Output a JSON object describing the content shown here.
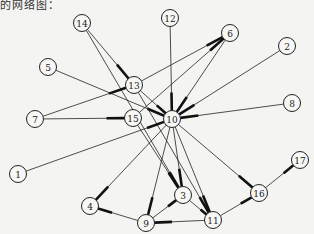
{
  "header": {
    "text": "的网络图："
  },
  "graph": {
    "nodes": [
      {
        "id": "1",
        "x": 18,
        "y": 174
      },
      {
        "id": "2",
        "x": 287,
        "y": 46
      },
      {
        "id": "3",
        "x": 183,
        "y": 195
      },
      {
        "id": "4",
        "x": 90,
        "y": 206
      },
      {
        "id": "5",
        "x": 48,
        "y": 67
      },
      {
        "id": "6",
        "x": 230,
        "y": 33
      },
      {
        "id": "7",
        "x": 35,
        "y": 119
      },
      {
        "id": "8",
        "x": 292,
        "y": 103
      },
      {
        "id": "9",
        "x": 146,
        "y": 223
      },
      {
        "id": "10",
        "x": 172,
        "y": 119
      },
      {
        "id": "11",
        "x": 213,
        "y": 220
      },
      {
        "id": "12",
        "x": 170,
        "y": 18
      },
      {
        "id": "13",
        "x": 134,
        "y": 85
      },
      {
        "id": "14",
        "x": 82,
        "y": 23
      },
      {
        "id": "15",
        "x": 133,
        "y": 118
      },
      {
        "id": "16",
        "x": 259,
        "y": 193
      },
      {
        "id": "17",
        "x": 300,
        "y": 160
      }
    ],
    "edges": [
      {
        "from": "14",
        "to": "13"
      },
      {
        "from": "14",
        "to": "3"
      },
      {
        "from": "5",
        "to": "10"
      },
      {
        "from": "7",
        "to": "13"
      },
      {
        "from": "7",
        "to": "15"
      },
      {
        "from": "13",
        "to": "6"
      },
      {
        "from": "13",
        "to": "10"
      },
      {
        "from": "13",
        "to": "11"
      },
      {
        "from": "15",
        "to": "6"
      },
      {
        "from": "15",
        "to": "3"
      },
      {
        "from": "12",
        "to": "10"
      },
      {
        "from": "6",
        "to": "10"
      },
      {
        "from": "2",
        "to": "10"
      },
      {
        "from": "8",
        "to": "10"
      },
      {
        "from": "1",
        "to": "10"
      },
      {
        "from": "10",
        "to": "4"
      },
      {
        "from": "10",
        "to": "9"
      },
      {
        "from": "10",
        "to": "3"
      },
      {
        "from": "10",
        "to": "11"
      },
      {
        "from": "10",
        "to": "16"
      },
      {
        "from": "9",
        "to": "4"
      },
      {
        "from": "9",
        "to": "3"
      },
      {
        "from": "11",
        "to": "9"
      },
      {
        "from": "11",
        "to": "16"
      },
      {
        "from": "16",
        "to": "17"
      },
      {
        "from": "3",
        "to": "11"
      }
    ]
  }
}
